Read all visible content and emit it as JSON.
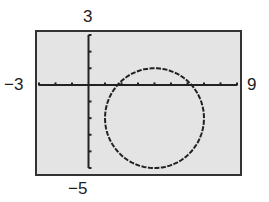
{
  "labels": {
    "ymax": "3",
    "ymin": "−5",
    "xmin": "−3",
    "xmax": "9"
  },
  "colors": {
    "screen_bg": "#e4e4e4",
    "frame": "#333333",
    "axis": "#222222",
    "curve": "#222222"
  },
  "chart_data": {
    "type": "line",
    "title": "",
    "equation": "(x-4)^2 + (y+2)^2 = 9",
    "center": [
      4,
      -2
    ],
    "radius": 3,
    "xlim": [
      -3,
      9
    ],
    "ylim": [
      -5,
      3
    ],
    "xscale": 1,
    "yscale": 1,
    "x_ticks": [
      -3,
      -2,
      -1,
      0,
      1,
      2,
      3,
      4,
      5,
      6,
      7,
      8,
      9
    ],
    "y_ticks": [
      -5,
      -4,
      -3,
      -2,
      -1,
      0,
      1,
      2,
      3
    ],
    "window_labels": {
      "xmin": "-3",
      "xmax": "9",
      "ymin": "-5",
      "ymax": "3"
    },
    "grid": false,
    "legend": null
  }
}
